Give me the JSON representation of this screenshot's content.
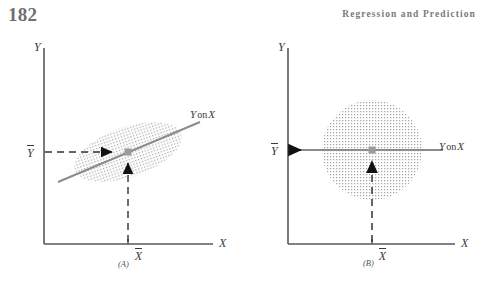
{
  "page": {
    "folio": "182",
    "running_head": "Regression and Prediction"
  },
  "colors": {
    "axis": "#58585a",
    "cloud_dot": "#9a9a9a",
    "regression_line": "#8c8c8c",
    "arrow": "#111111",
    "centroid": "#9b9b9b",
    "text": "#3a3a3a",
    "header_text": "#7a7a7a"
  },
  "figure": {
    "panels": [
      {
        "id": "A",
        "tag": "(A)",
        "y_axis_label": "Y",
        "x_axis_label": "X",
        "y_mean_label": "Y",
        "x_mean_label": "X",
        "regression_label_var1": "Y",
        "regression_label_conn": "on",
        "regression_label_var2": "X",
        "cloud_shape": "tilted-ellipse",
        "correlation": "positive"
      },
      {
        "id": "B",
        "tag": "(B)",
        "y_axis_label": "Y",
        "x_axis_label": "X",
        "y_mean_label": "Y",
        "x_mean_label": "X",
        "regression_label_var1": "Y",
        "regression_label_conn": "on",
        "regression_label_var2": "X",
        "cloud_shape": "circle",
        "correlation": "zero"
      }
    ]
  },
  "caption": {
    "text": ""
  }
}
